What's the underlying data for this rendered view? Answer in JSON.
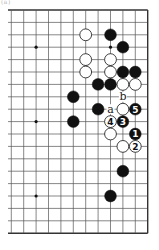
{
  "figure_label": "(a)",
  "board": {
    "size": 19,
    "visible_columns_from_right": 12,
    "grid_origin": {
      "right_x": 147.7,
      "top_y": 10
    },
    "spacing": 12.4,
    "left_extent_x": 8,
    "line_color": "#555555",
    "edge_color": "#333333",
    "star_points": [
      [
        10,
        4
      ],
      [
        4,
        4
      ],
      [
        10,
        10
      ],
      [
        10,
        16
      ]
    ]
  },
  "stones": [
    {
      "color": "white",
      "col": 6,
      "row": 3,
      "label": ""
    },
    {
      "color": "black",
      "col": 4,
      "row": 3,
      "label": ""
    },
    {
      "color": "black",
      "col": 3,
      "row": 4,
      "label": ""
    },
    {
      "color": "white",
      "col": 6,
      "row": 5,
      "label": ""
    },
    {
      "color": "white",
      "col": 4,
      "row": 5,
      "label": ""
    },
    {
      "color": "white",
      "col": 6,
      "row": 6,
      "label": ""
    },
    {
      "color": "white",
      "col": 4,
      "row": 6,
      "label": ""
    },
    {
      "color": "black",
      "col": 3,
      "row": 6,
      "label": ""
    },
    {
      "color": "black",
      "col": 2,
      "row": 6,
      "label": ""
    },
    {
      "color": "black",
      "col": 5,
      "row": 7,
      "label": ""
    },
    {
      "color": "black",
      "col": 4,
      "row": 7,
      "label": ""
    },
    {
      "color": "white",
      "col": 3,
      "row": 7,
      "label": ""
    },
    {
      "color": "white",
      "col": 2,
      "row": 7,
      "label": ""
    },
    {
      "color": "black",
      "col": 7,
      "row": 8,
      "label": ""
    },
    {
      "color": "black",
      "col": 5,
      "row": 9,
      "label": ""
    },
    {
      "color": "white",
      "col": 3,
      "row": 9,
      "label": ""
    },
    {
      "color": "black",
      "col": 2,
      "row": 9,
      "label": "5"
    },
    {
      "color": "black",
      "col": 7,
      "row": 10,
      "label": ""
    },
    {
      "color": "white",
      "col": 4,
      "row": 10,
      "label": "4"
    },
    {
      "color": "black",
      "col": 3,
      "row": 10,
      "label": "3"
    },
    {
      "color": "white",
      "col": 4,
      "row": 11,
      "label": ""
    },
    {
      "color": "black",
      "col": 2,
      "row": 11,
      "label": "1"
    },
    {
      "color": "white",
      "col": 3,
      "row": 12,
      "label": ""
    },
    {
      "color": "white",
      "col": 2,
      "row": 12,
      "label": "2"
    },
    {
      "color": "black",
      "col": 3,
      "row": 14,
      "label": ""
    },
    {
      "color": "black",
      "col": 4,
      "row": 16,
      "label": ""
    }
  ],
  "point_labels": [
    {
      "text": "b",
      "col": 3,
      "row": 8
    },
    {
      "text": "a",
      "col": 4,
      "row": 9
    }
  ]
}
